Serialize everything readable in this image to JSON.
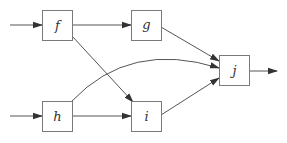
{
  "diagram": {
    "type": "directed-graph",
    "colors": {
      "stroke": "#555555",
      "box_border": "#7a7a7a",
      "text": "#333333",
      "background": "#ffffff"
    },
    "nodes": [
      {
        "id": "f",
        "label": "f",
        "x": 42,
        "y": 10,
        "w": 30,
        "h": 30
      },
      {
        "id": "g",
        "label": "g",
        "x": 131,
        "y": 10,
        "w": 30,
        "h": 30
      },
      {
        "id": "h",
        "label": "h",
        "x": 42,
        "y": 101,
        "w": 30,
        "h": 30
      },
      {
        "id": "i",
        "label": "i",
        "x": 131,
        "y": 101,
        "w": 30,
        "h": 30
      },
      {
        "id": "j",
        "label": "j",
        "x": 219,
        "y": 55,
        "w": 30,
        "h": 30
      }
    ],
    "edges": [
      {
        "from": "input",
        "to": "f"
      },
      {
        "from": "input",
        "to": "h"
      },
      {
        "from": "f",
        "to": "g"
      },
      {
        "from": "f",
        "to": "i"
      },
      {
        "from": "g",
        "to": "j"
      },
      {
        "from": "h",
        "to": "i"
      },
      {
        "from": "h",
        "to": "j",
        "curved": true
      },
      {
        "from": "i",
        "to": "j"
      },
      {
        "from": "j",
        "to": "output"
      }
    ]
  }
}
